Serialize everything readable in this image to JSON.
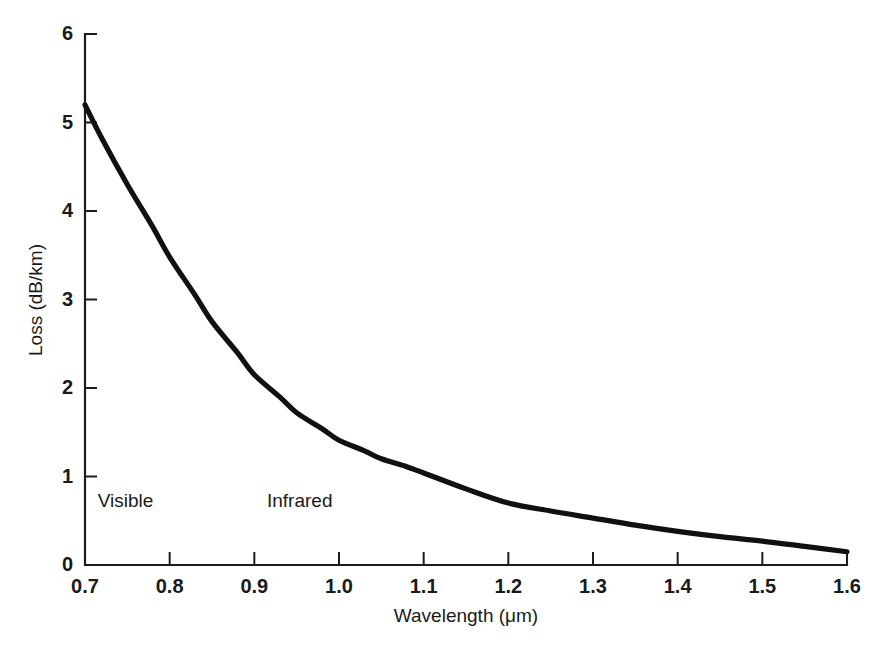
{
  "chart_data": {
    "type": "line",
    "title": "",
    "subtitle": "",
    "xlabel": "Wavelength (μm)",
    "ylabel": "Loss (dB/km)",
    "xlim": [
      0.7,
      1.6
    ],
    "ylim": [
      0,
      6
    ],
    "grid": false,
    "legend": null,
    "legend_position": "none",
    "xticks": [
      "0.7",
      "0.8",
      "0.9",
      "1.0",
      "1.1",
      "1.2",
      "1.3",
      "1.4",
      "1.5",
      "1.6"
    ],
    "xtick_values": [
      0.7,
      0.8,
      0.9,
      1.0,
      1.1,
      1.2,
      1.3,
      1.4,
      1.5,
      1.6
    ],
    "yticks": [
      "0",
      "1",
      "2",
      "3",
      "4",
      "5",
      "6"
    ],
    "ytick_values": [
      0,
      1,
      2,
      3,
      4,
      5,
      6
    ],
    "x": [
      0.7,
      0.72,
      0.75,
      0.78,
      0.8,
      0.83,
      0.85,
      0.88,
      0.9,
      0.93,
      0.95,
      0.98,
      1.0,
      1.03,
      1.05,
      1.08,
      1.1,
      1.15,
      1.2,
      1.25,
      1.3,
      1.35,
      1.4,
      1.45,
      1.5,
      1.55,
      1.6
    ],
    "values": [
      5.2,
      4.82,
      4.3,
      3.82,
      3.48,
      3.05,
      2.75,
      2.4,
      2.15,
      1.9,
      1.72,
      1.54,
      1.41,
      1.29,
      1.2,
      1.11,
      1.04,
      0.86,
      0.7,
      0.61,
      0.53,
      0.45,
      0.38,
      0.32,
      0.27,
      0.21,
      0.15
    ],
    "series": [
      {
        "name": "Fiber attenuation",
        "color": "#111111",
        "values": [
          5.2,
          4.82,
          4.3,
          3.82,
          3.48,
          3.05,
          2.75,
          2.4,
          2.15,
          1.9,
          1.72,
          1.54,
          1.41,
          1.29,
          1.2,
          1.11,
          1.04,
          0.86,
          0.7,
          0.61,
          0.53,
          0.45,
          0.38,
          0.32,
          0.27,
          0.21,
          0.15
        ]
      }
    ],
    "annotations": [
      {
        "text": "Visible",
        "x": 0.715,
        "y": 0.66
      },
      {
        "text": "Infrared",
        "x": 0.915,
        "y": 0.66
      }
    ]
  },
  "annotations": {
    "visible_label": "Visible",
    "infrared_label": "Infrared"
  },
  "axes": {
    "x_title": "Wavelength (μm)",
    "y_title": "Loss (dB/km)"
  },
  "colors": {
    "curve": "#111111",
    "axis": "#1c1c1c",
    "text": "#1a1a1a",
    "background": "#ffffff"
  }
}
